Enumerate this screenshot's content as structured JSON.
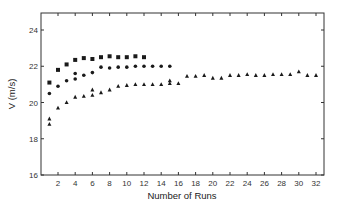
{
  "chart_data": {
    "type": "scatter",
    "title": "",
    "xlabel": "Number of Runs",
    "ylabel": "V (m/s)",
    "xlim": [
      0,
      33
    ],
    "ylim": [
      16,
      25
    ],
    "xticks": [
      2,
      4,
      6,
      8,
      10,
      12,
      14,
      16,
      18,
      20,
      22,
      24,
      26,
      28,
      30,
      32
    ],
    "yticks": [
      16,
      18,
      20,
      22,
      24
    ],
    "grid": false,
    "legend": null,
    "series": [
      {
        "name": "squares",
        "marker": "square",
        "points": [
          [
            1,
            21.1
          ],
          [
            2,
            21.8
          ],
          [
            3,
            22.1
          ],
          [
            4,
            22.35
          ],
          [
            5,
            22.45
          ],
          [
            6,
            22.4
          ],
          [
            7,
            22.5
          ],
          [
            8,
            22.55
          ],
          [
            9,
            22.5
          ],
          [
            10,
            22.5
          ],
          [
            11,
            22.55
          ],
          [
            12,
            22.5
          ]
        ]
      },
      {
        "name": "circles",
        "marker": "circle",
        "points": [
          [
            1,
            20.5
          ],
          [
            2,
            20.9
          ],
          [
            3,
            21.2
          ],
          [
            4,
            21.3
          ],
          [
            4,
            21.6
          ],
          [
            5,
            21.5
          ],
          [
            6,
            21.65
          ],
          [
            7,
            21.95
          ],
          [
            8,
            21.9
          ],
          [
            9,
            21.95
          ],
          [
            10,
            21.95
          ],
          [
            11,
            22.0
          ],
          [
            12,
            22.0
          ],
          [
            13,
            22.0
          ],
          [
            14,
            22.0
          ],
          [
            15,
            22.0
          ]
        ]
      },
      {
        "name": "triangles",
        "marker": "triangle",
        "points": [
          [
            1,
            19.1
          ],
          [
            1,
            18.8
          ],
          [
            2,
            19.7
          ],
          [
            3,
            20.0
          ],
          [
            4,
            20.3
          ],
          [
            5,
            20.35
          ],
          [
            6,
            20.4
          ],
          [
            6,
            20.7
          ],
          [
            7,
            20.55
          ],
          [
            8,
            20.7
          ],
          [
            9,
            20.9
          ],
          [
            10,
            20.95
          ],
          [
            11,
            21.0
          ],
          [
            12,
            21.0
          ],
          [
            13,
            21.0
          ],
          [
            14,
            21.0
          ],
          [
            15,
            21.05
          ],
          [
            15,
            21.2
          ],
          [
            16,
            21.05
          ],
          [
            17,
            21.45
          ],
          [
            18,
            21.45
          ],
          [
            19,
            21.5
          ],
          [
            20,
            21.35
          ],
          [
            21,
            21.35
          ],
          [
            22,
            21.5
          ],
          [
            23,
            21.5
          ],
          [
            24,
            21.55
          ],
          [
            25,
            21.5
          ],
          [
            26,
            21.5
          ],
          [
            27,
            21.55
          ],
          [
            28,
            21.55
          ],
          [
            29,
            21.55
          ],
          [
            30,
            21.7
          ],
          [
            31,
            21.5
          ],
          [
            32,
            21.5
          ]
        ]
      }
    ]
  },
  "colors": {
    "marker": "#1a1a1a",
    "axis": "#333333"
  }
}
